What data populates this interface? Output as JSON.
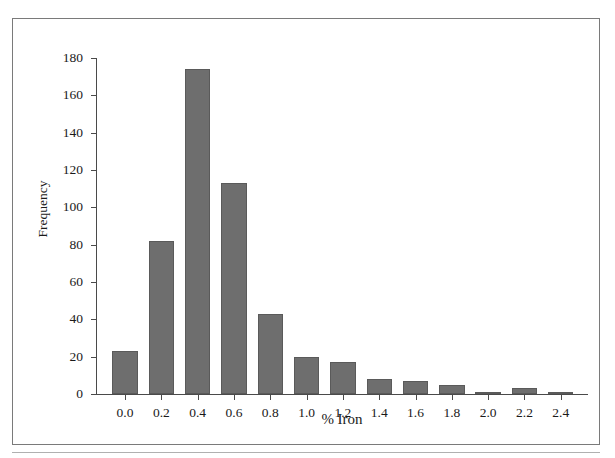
{
  "chart_data": {
    "type": "bar",
    "title": "",
    "subtitle": "",
    "xlabel": "% Iron",
    "ylabel": "Frequency",
    "categories": [
      "0.0",
      "0.2",
      "0.4",
      "0.6",
      "0.8",
      "1.0",
      "1.2",
      "1.4",
      "1.6",
      "1.8",
      "2.0",
      "2.2",
      "2.4"
    ],
    "values": [
      23,
      82,
      174,
      113,
      43,
      20,
      17,
      8,
      7,
      5,
      1,
      3,
      1
    ],
    "xtick_labels": [
      "0.0",
      "0.2",
      "0.4",
      "0.6",
      "0.8",
      "1.0",
      "1.2",
      "1.4",
      "1.6",
      "1.8",
      "2.0",
      "2.2",
      "2.4"
    ],
    "ytick_labels": [
      "0",
      "20",
      "40",
      "60",
      "80",
      "100",
      "120",
      "140",
      "160",
      "180"
    ],
    "ytick_values": [
      0,
      20,
      40,
      60,
      80,
      100,
      120,
      140,
      160,
      180
    ],
    "ylim": [
      0,
      180
    ],
    "xlim": [
      -0.1,
      2.5
    ],
    "grid": false,
    "legend": null,
    "bar_color": "#6e6e6e",
    "axis_color": "#4a4a4a",
    "frame_color": "#7a7a7a",
    "background": "#ffffff"
  }
}
